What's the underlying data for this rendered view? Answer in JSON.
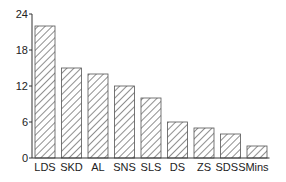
{
  "chart_data": {
    "type": "bar",
    "title": "",
    "xlabel": "",
    "ylabel": "",
    "categories": [
      "LDS",
      "SKD",
      "AL",
      "SNS",
      "SLS",
      "DS",
      "ZS",
      "SDSS",
      "Mins"
    ],
    "values": [
      22,
      15,
      14,
      12,
      10,
      6,
      5,
      4,
      2
    ],
    "ylim": [
      0,
      24
    ],
    "yticks": [
      0,
      6,
      12,
      18,
      24
    ],
    "grid": false,
    "legend": null,
    "bar_style": "diagonal-hatch",
    "colors": {
      "bar_fill": "#ffffff",
      "bar_edge": "#555555",
      "hatch": "#444444",
      "axis": "#333333"
    }
  }
}
